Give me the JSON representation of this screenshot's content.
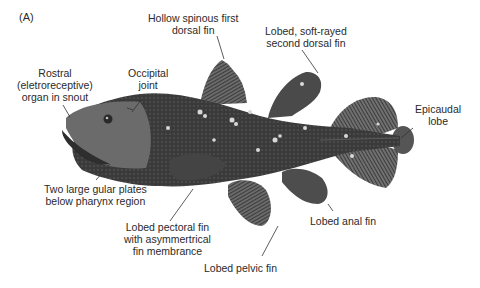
{
  "figure": {
    "panel_label": "(A)",
    "labels": {
      "first_dorsal": [
        "Hollow spinous first",
        "dorsal fin"
      ],
      "second_dorsal": [
        "Lobed, soft-rayed",
        "second dorsal fin"
      ],
      "rostral": [
        "Rostral",
        "(eletroreceptive)",
        "organ in snout"
      ],
      "occipital": [
        "Occipital",
        "joint"
      ],
      "epicaudal": [
        "Epicaudal",
        "lobe"
      ],
      "gular": [
        "Two large gular plates",
        "below pharynx region"
      ],
      "pectoral": [
        "Lobed pectoral fin",
        "with asymmertrical",
        "fin membrance"
      ],
      "anal": [
        "Lobed anal fin"
      ],
      "pelvic": [
        "Lobed pelvic fin"
      ]
    },
    "colors": {
      "body": "#3a3a3a",
      "fin": "#5a5a5a",
      "spots": "#d8d8d8",
      "leader": "#333333",
      "text": "#2a2a2a"
    }
  }
}
